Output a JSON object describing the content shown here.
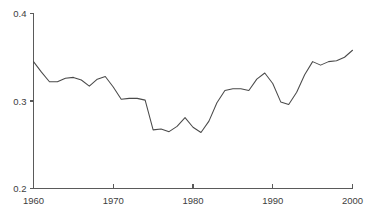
{
  "chart_data": {
    "type": "line",
    "title": "",
    "subtitle": "",
    "xlabel": "",
    "ylabel": "",
    "xlim": [
      1960,
      2000
    ],
    "ylim": [
      0.2,
      0.4
    ],
    "grid": false,
    "legend": null,
    "x_ticks": [
      1960,
      1970,
      1980,
      1990,
      2000
    ],
    "x_tick_labels": [
      "1960",
      "1970",
      "1980",
      "1990",
      "2000"
    ],
    "y_ticks": [
      0.2,
      0.3,
      0.4
    ],
    "y_tick_labels": [
      "0.2",
      "0.3",
      "0.4"
    ],
    "line_color": "#4a4a4a",
    "axis_color": "#5a5a5a",
    "background_color": "#ffffff",
    "series": [
      {
        "name": "value",
        "x": [
          1960,
          1961,
          1962,
          1963,
          1964,
          1965,
          1966,
          1967,
          1968,
          1969,
          1970,
          1971,
          1972,
          1973,
          1974,
          1975,
          1976,
          1977,
          1978,
          1979,
          1980,
          1981,
          1982,
          1983,
          1984,
          1985,
          1986,
          1987,
          1988,
          1989,
          1990,
          1991,
          1992,
          1993,
          1994,
          1995,
          1996,
          1997,
          1998,
          1999,
          2000
        ],
        "values": [
          0.345,
          0.333,
          0.322,
          0.322,
          0.326,
          0.327,
          0.324,
          0.317,
          0.325,
          0.328,
          0.316,
          0.302,
          0.303,
          0.303,
          0.301,
          0.267,
          0.268,
          0.265,
          0.271,
          0.281,
          0.27,
          0.264,
          0.277,
          0.298,
          0.312,
          0.314,
          0.314,
          0.312,
          0.325,
          0.332,
          0.32,
          0.299,
          0.296,
          0.31,
          0.33,
          0.345,
          0.341,
          0.345,
          0.346,
          0.35,
          0.358
        ]
      }
    ]
  }
}
